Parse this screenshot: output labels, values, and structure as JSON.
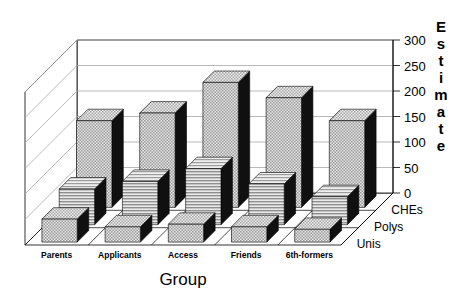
{
  "chart_data": {
    "type": "bar",
    "title": "",
    "subtitle": "",
    "xlabel": "Group",
    "ylabel": "Estimate",
    "zlabel": "",
    "categories": [
      "Parents",
      "Applicants",
      "Access",
      "Friends",
      "6th-formers"
    ],
    "series": [
      {
        "name": "Unis",
        "values": [
          45,
          30,
          35,
          30,
          25
        ],
        "fill": "checker",
        "row": 0
      },
      {
        "name": "Polys",
        "values": [
          70,
          85,
          110,
          80,
          55
        ],
        "fill": "hlines",
        "row": 1
      },
      {
        "name": "CHEs",
        "values": [
          170,
          185,
          245,
          215,
          170
        ],
        "fill": "checker",
        "row": 2
      }
    ],
    "yticks": [
      0,
      50,
      100,
      150,
      200,
      250,
      300
    ],
    "ylim": [
      0,
      300
    ],
    "grid": true,
    "legend": "none",
    "projection": "3d",
    "depth_axis_labels": [
      "Unis",
      "Polys",
      "CHEs"
    ]
  },
  "colors": {
    "bar_face": "#c8c8c8",
    "bar_side": "#101010",
    "bar_top": "#d8d8d8",
    "axis": "#000000",
    "grid": "#a8a8a8",
    "background": "#ffffff",
    "text": "#000000"
  },
  "yaxis": {
    "title_letters": [
      "E",
      "s",
      "t",
      "i",
      "m",
      "a",
      "t",
      "e"
    ]
  }
}
